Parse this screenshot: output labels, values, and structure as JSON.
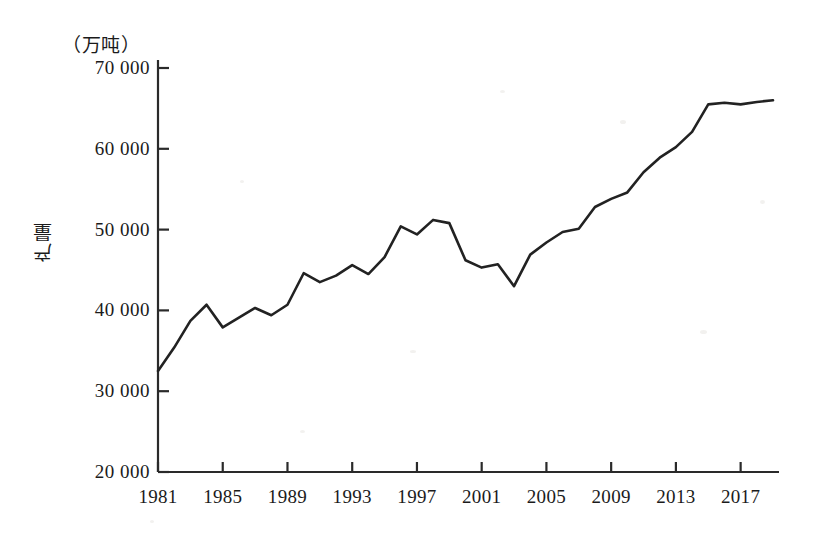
{
  "chart_data": {
    "type": "line",
    "title": "",
    "unit_note": "（万吨）",
    "ylabel": "产量",
    "xlabel": "",
    "ylim": [
      20000,
      70000
    ],
    "ytick_values": [
      20000,
      30000,
      40000,
      50000,
      60000,
      70000
    ],
    "ytick_labels": [
      "20 000",
      "30 000",
      "40 000",
      "50 000",
      "60 000",
      "70 000"
    ],
    "xlim": [
      1981,
      2019
    ],
    "xtick_values": [
      1981,
      1985,
      1989,
      1993,
      1997,
      2001,
      2005,
      2009,
      2013,
      2017
    ],
    "xtick_labels": [
      "1981",
      "1985",
      "1989",
      "1993",
      "1997",
      "2001",
      "2005",
      "2009",
      "2013",
      "2017"
    ],
    "grid": false,
    "legend": false,
    "line_color": "#222222",
    "x": [
      1981,
      1982,
      1983,
      1984,
      1985,
      1986,
      1987,
      1988,
      1989,
      1990,
      1991,
      1992,
      1993,
      1994,
      1995,
      1996,
      1997,
      1998,
      1999,
      2000,
      2001,
      2002,
      2003,
      2004,
      2005,
      2006,
      2007,
      2008,
      2009,
      2010,
      2011,
      2012,
      2013,
      2014,
      2015,
      2016,
      2017,
      2018,
      2019
    ],
    "values": [
      32500,
      35400,
      38700,
      40700,
      37900,
      39100,
      40300,
      39400,
      40700,
      44600,
      43500,
      44300,
      45600,
      44500,
      46600,
      50400,
      49400,
      51200,
      50800,
      46200,
      45300,
      45700,
      43000,
      46900,
      48400,
      49700,
      50100,
      52800,
      53800,
      54600,
      57100,
      58900,
      60200,
      62100,
      65500,
      65700,
      65500,
      65800,
      66000
    ]
  }
}
